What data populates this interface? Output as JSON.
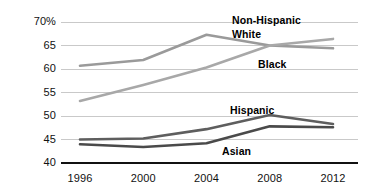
{
  "chart_data": {
    "type": "line",
    "title": "",
    "xlabel": "",
    "ylabel": "",
    "x": [
      1996,
      2000,
      2004,
      2008,
      2012
    ],
    "categories": [
      "1996",
      "2000",
      "2004",
      "2008",
      "2012"
    ],
    "ylim": [
      40,
      70
    ],
    "xlim": [
      1996,
      2012
    ],
    "yticks": [
      40,
      45,
      50,
      55,
      60,
      65,
      70
    ],
    "ytick_labels": [
      "40",
      "45",
      "50",
      "55",
      "60",
      "65",
      "70%"
    ],
    "grid": true,
    "grid_axis": "y",
    "legend": "inline-annotations",
    "series": [
      {
        "name": "Non-Hispanic White",
        "label_lines": [
          "Non-Hispanic",
          "White"
        ],
        "color": "#9a9a9a",
        "values": [
          60.7,
          61.9,
          67.3,
          65.0,
          64.4
        ]
      },
      {
        "name": "Black",
        "label_lines": [
          "Black"
        ],
        "color": "#a8a8a8",
        "values": [
          53.2,
          56.6,
          60.3,
          65.0,
          66.4
        ]
      },
      {
        "name": "Hispanic",
        "label_lines": [
          "Hispanic"
        ],
        "color": "#5e5e5e",
        "values": [
          45.0,
          45.2,
          47.2,
          50.2,
          48.3
        ]
      },
      {
        "name": "Asian",
        "label_lines": [
          "Asian"
        ],
        "color": "#4a4a4a",
        "values": [
          44.0,
          43.4,
          44.2,
          47.8,
          47.6
        ]
      }
    ],
    "annotations": [
      {
        "text": "Non-Hispanic",
        "x": 232,
        "y": 14
      },
      {
        "text": "White",
        "x": 232,
        "y": 28
      },
      {
        "text": "Black",
        "x": 258,
        "y": 58
      },
      {
        "text": "Hispanic",
        "x": 230,
        "y": 104
      },
      {
        "text": "Asian",
        "x": 222,
        "y": 145
      }
    ],
    "axis_color": "#111111",
    "grid_color": "#c9c9c9",
    "background": "#ffffff"
  }
}
